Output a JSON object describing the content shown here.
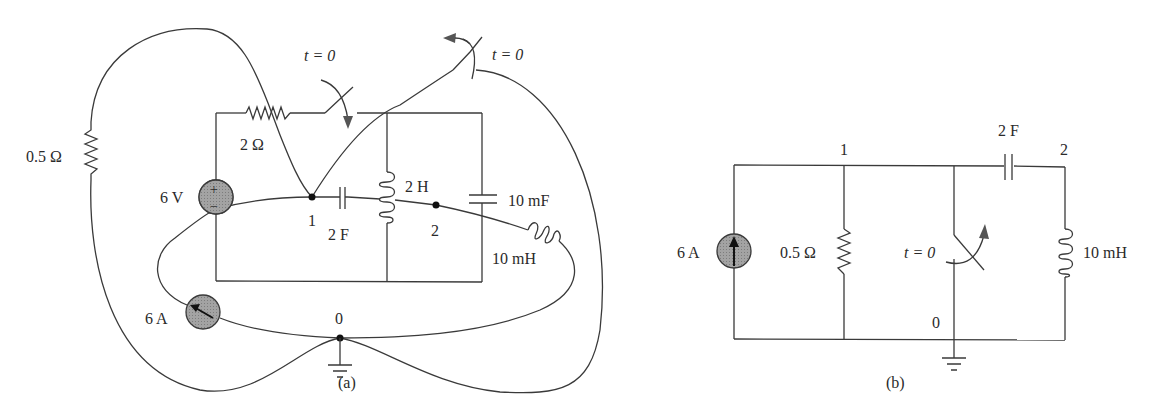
{
  "figure": {
    "captions": {
      "a": "(a)",
      "b": "(b)"
    },
    "background_color": "#ffffff",
    "line_color": "#3a3a3a",
    "source_fill_color": "#9a9a9a"
  },
  "circuit_a": {
    "resistor_outer": "0.5 Ω",
    "resistor_top": "2 Ω",
    "voltage_source": "6 V",
    "voltage_source_plus": "+",
    "voltage_source_minus": "−",
    "current_source": "6 A",
    "capacitor_node1": "2 F",
    "inductor_mid": "2 H",
    "capacitor_right": "10 mF",
    "inductor_right": "10 mH",
    "switch_left_label": "t = 0",
    "switch_right_label": "t = 0",
    "node_1": "1",
    "node_2": "2",
    "node_0": "0"
  },
  "circuit_b": {
    "current_source": "6 A",
    "resistor": "0.5 Ω",
    "switch_label": "t = 0",
    "capacitor": "2 F",
    "inductor": "10 mH",
    "node_1": "1",
    "node_2": "2",
    "node_0": "0"
  }
}
